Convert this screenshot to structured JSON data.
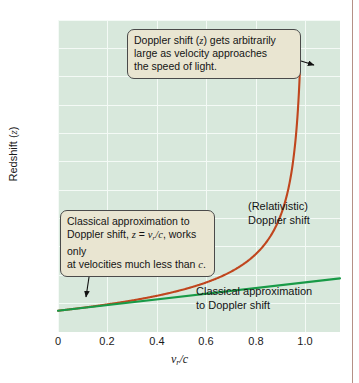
{
  "figure": {
    "background_color": "#ffffff",
    "plot_background_color": "#d8e8dc",
    "gridline_color": "#f4faf6",
    "edge_rule_color": "#9c6b5e"
  },
  "axes": {
    "y_label_prefix": "Redshift (",
    "y_label_var": "z",
    "y_label_suffix": ")",
    "y_ticks": [
      "10",
      "9",
      "8",
      "7",
      "6",
      "5",
      "4",
      "3",
      "2",
      "1",
      "0"
    ],
    "x_ticks": [
      "0",
      "0.2",
      "0.4",
      "0.6",
      "0.8",
      "1.0"
    ],
    "x_label_var": "v",
    "x_label_sub": "r",
    "x_label_rest": "/c"
  },
  "annotations": {
    "top_callout": {
      "line1_pre": "Doppler shift (",
      "line1_var": "z",
      "line1_post": ") gets arbitrarily",
      "line2": "large as velocity approaches",
      "line3": "the speed of light."
    },
    "left_callout": {
      "line1": "Classical approximation to",
      "line2_pre": "Doppler shift, ",
      "line2_eq_z": "z",
      "line2_eq_mid": " = ",
      "line2_eq_v": "v",
      "line2_eq_sub": "r",
      "line2_eq_tail": "/c",
      "line2_post": ", works only",
      "line3_pre": "at velocities much less than ",
      "line3_var": "c",
      "line3_post": "."
    },
    "relativistic_label": {
      "line1": "(Relativistic)",
      "line2": "Doppler shift"
    },
    "classical_label": {
      "line1": "Classical approximation",
      "line2": "to Doppler shift"
    }
  },
  "chart_data": {
    "type": "line",
    "title": "",
    "xlabel": "v_r/c",
    "ylabel": "Redshift (z)",
    "xlim": [
      0,
      1.14
    ],
    "ylim": [
      -0.75,
      10.25
    ],
    "grid": true,
    "legend": "inline-annotations",
    "x_tick_values": [
      0,
      0.2,
      0.4,
      0.6,
      0.8,
      1.0
    ],
    "y_tick_values": [
      0,
      1,
      2,
      3,
      4,
      5,
      6,
      7,
      8,
      9,
      10
    ],
    "series": [
      {
        "name": "(Relativistic) Doppler shift",
        "color": "#c0461e",
        "formula": "z = sqrt((1+b)/(1-b)) - 1",
        "x": [
          0,
          0.05,
          0.1,
          0.15,
          0.2,
          0.25,
          0.3,
          0.35,
          0.4,
          0.45,
          0.5,
          0.55,
          0.6,
          0.65,
          0.7,
          0.75,
          0.8,
          0.85,
          0.88,
          0.9,
          0.92,
          0.94,
          0.95,
          0.96,
          0.965,
          0.97,
          0.975,
          0.978
        ],
        "values": [
          0,
          0.051,
          0.106,
          0.164,
          0.225,
          0.291,
          0.363,
          0.441,
          0.528,
          0.626,
          0.732,
          0.856,
          1.0,
          1.168,
          1.38,
          1.646,
          2.0,
          2.513,
          2.96,
          3.359,
          3.899,
          4.69,
          5.245,
          6.0,
          6.49,
          7.1,
          7.888,
          8.47
        ]
      },
      {
        "name": "Classical approximation to Doppler shift",
        "color": "#189a47",
        "formula": "z = v_r/c",
        "x": [
          0,
          1.14
        ],
        "values": [
          0,
          1.14
        ]
      }
    ],
    "annotations": [
      {
        "text": "Doppler shift (z) gets arbitrarily large as velocity approaches the speed of light.",
        "points_to_series": "(Relativistic) Doppler shift"
      },
      {
        "text": "Classical approximation to Doppler shift, z = v_r/c, works only at velocities much less than c.",
        "points_to_series": "Classical approximation to Doppler shift"
      }
    ]
  }
}
